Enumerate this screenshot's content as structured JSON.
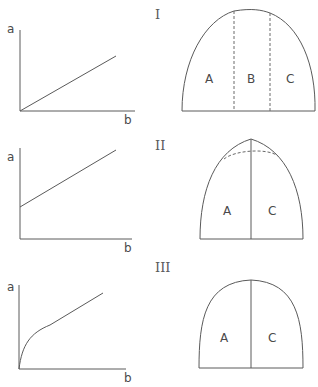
{
  "figure": {
    "panels": [
      {
        "id": "I",
        "roman": "I",
        "graph": {
          "y_label": "a",
          "x_label": "b",
          "curve": "linear through origin"
        },
        "shape": {
          "regions": [
            "A",
            "B",
            "C"
          ],
          "dividers": "two dashed vertical lines"
        }
      },
      {
        "id": "II",
        "roman": "II",
        "graph": {
          "y_label": "a",
          "x_label": "b",
          "curve": "linear with positive intercept"
        },
        "shape": {
          "regions": [
            "A",
            "C"
          ],
          "dividers": "one solid vertical line; dashed arc below pointed apex"
        }
      },
      {
        "id": "III",
        "roman": "III",
        "graph": {
          "y_label": "a",
          "x_label": "b",
          "curve": "concave rise from origin then linear"
        },
        "shape": {
          "regions": [
            "A",
            "C"
          ],
          "dividers": "one solid vertical line"
        }
      }
    ]
  },
  "colors": {
    "line": "#5a5a5a",
    "text": "#4a4a4a",
    "background": "#ffffff"
  }
}
